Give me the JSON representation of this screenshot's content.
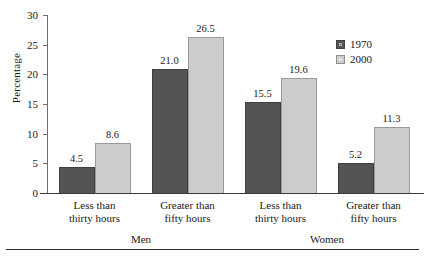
{
  "chart_data": {
    "type": "bar",
    "title": "",
    "xlabel": "",
    "ylabel": "Percentage",
    "ylim": [
      0,
      30
    ],
    "yticks": [
      0,
      5,
      10,
      15,
      20,
      25,
      30
    ],
    "ytick_labels": [
      "0",
      "5",
      "10",
      "15",
      "20",
      "25",
      "30"
    ],
    "grid": false,
    "legend_position": "top-right",
    "categories": [
      "Less than thirty hours",
      "Greater than fifty hours",
      "Less than thirty hours",
      "Greater than fifty hours"
    ],
    "category_lines": [
      [
        "Less than",
        "thirty hours"
      ],
      [
        "Greater than",
        "fifty hours"
      ],
      [
        "Less than",
        "thirty hours"
      ],
      [
        "Greater than",
        "fifty hours"
      ]
    ],
    "groups": [
      {
        "label": "Men",
        "category_indices": [
          0,
          1
        ]
      },
      {
        "label": "Women",
        "category_indices": [
          2,
          3
        ]
      }
    ],
    "series": [
      {
        "name": "1970",
        "color": "#545454",
        "values": [
          4.5,
          21.0,
          15.5,
          5.2
        ],
        "value_labels": [
          "4.5",
          "21.0",
          "15.5",
          "5.2"
        ]
      },
      {
        "name": "2000",
        "color": "#cccccc",
        "values": [
          8.6,
          26.5,
          19.6,
          11.3
        ],
        "value_labels": [
          "8.6",
          "26.5",
          "19.6",
          "11.3"
        ]
      }
    ]
  },
  "legend": {
    "entries": [
      {
        "label": "1970",
        "swatch": "dark-gray-swatch-icon"
      },
      {
        "label": "2000",
        "swatch": "light-gray-swatch-icon"
      }
    ]
  },
  "axis": {
    "y_title": "Percentage"
  }
}
